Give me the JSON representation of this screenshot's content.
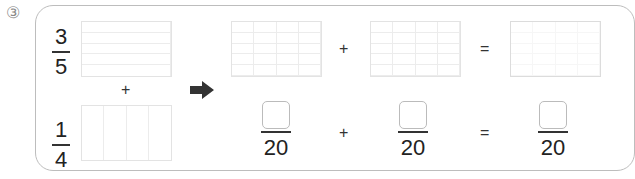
{
  "problem": {
    "number_label": "③",
    "left_column": {
      "fraction_a": {
        "numerator": "3",
        "denominator": "5",
        "grid_rows": 5,
        "grid_cols": 1
      },
      "operator": "+",
      "fraction_b": {
        "numerator": "1",
        "denominator": "4",
        "grid_rows": 1,
        "grid_cols": 4
      }
    },
    "arrow_icon": "right-arrow",
    "grid_equation": {
      "grid1": {
        "rows": 5,
        "cols": 4
      },
      "op1": "+",
      "grid2": {
        "rows": 5,
        "cols": 4
      },
      "op2": "=",
      "grid3": {
        "rows": 5,
        "cols": 4
      }
    },
    "fraction_equation": {
      "term1": {
        "numerator": "",
        "denominator": "20"
      },
      "op1": "+",
      "term2": {
        "numerator": "",
        "denominator": "20"
      },
      "op2": "=",
      "result": {
        "numerator": "",
        "denominator": "20"
      }
    }
  }
}
